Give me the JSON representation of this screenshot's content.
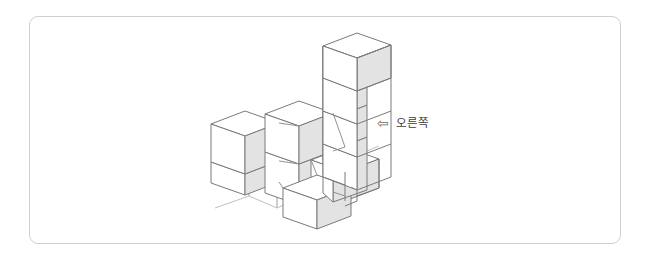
{
  "page": {
    "background_color": "#ffffff",
    "width": 649,
    "height": 263
  },
  "frame": {
    "border_color": "#cfcfcf",
    "corner_radius": 9
  },
  "direction_label": {
    "arrow_icon": "leftwards-white-arrow",
    "arrow_glyph": "⇦",
    "text": "오른쪽",
    "text_color": "#3d3d3d"
  },
  "scene": {
    "type": "isometric-cube-stack",
    "cube_size": 1,
    "palette": {
      "top_face": "#ffffff",
      "left_face": "#ffffff",
      "right_face": "#e3e3e3",
      "outline": "#7a7a7a",
      "hidden_outline": "#b8b8b8"
    },
    "description": "Isometric stack of unit cubes viewed from above-front",
    "columns": [
      {
        "name": "left-column",
        "grid_x": 0,
        "grid_y": 0,
        "height": 2
      },
      {
        "name": "middle-column",
        "grid_x": 1,
        "grid_y": 0,
        "height": 2
      },
      {
        "name": "tall-tower",
        "grid_x": 2,
        "grid_y": 0,
        "height": 5
      },
      {
        "name": "tower-front-cube",
        "grid_x": 2,
        "grid_y": 1,
        "height": 1
      },
      {
        "name": "front-single-cube",
        "grid_x": 1,
        "grid_y": 1,
        "height": 1
      }
    ],
    "total_cubes": 11
  }
}
